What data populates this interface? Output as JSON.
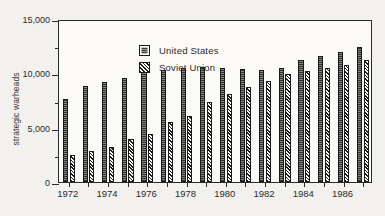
{
  "chart_data": {
    "type": "bar",
    "title": "",
    "xlabel": "",
    "ylabel": "strategic warheads",
    "ylim": [
      0,
      15000
    ],
    "yticks": [
      0,
      2500,
      5000,
      7500,
      10000,
      12500,
      15000
    ],
    "ytick_labels": [
      "0",
      "",
      "5,000",
      "",
      "10,000",
      "",
      "15,000"
    ],
    "ytick_major": [
      true,
      false,
      true,
      false,
      true,
      false,
      true
    ],
    "grid": false,
    "legend_position": "upper-left-inside",
    "categories": [
      "1972",
      "1973",
      "1974",
      "1975",
      "1976",
      "1977",
      "1978",
      "1979",
      "1980",
      "1981",
      "1982",
      "1983",
      "1984",
      "1985",
      "1986",
      "1987"
    ],
    "xtick_labels": [
      "1972",
      "",
      "1974",
      "",
      "1976",
      "",
      "1978",
      "",
      "1980",
      "",
      "1982",
      "",
      "1984",
      "",
      "1986",
      ""
    ],
    "series": [
      {
        "name": "United States",
        "color": "#6b6b6b",
        "pattern": "solid-dark",
        "values": [
          7600,
          8800,
          9200,
          9600,
          10200,
          10350,
          10450,
          10550,
          10450,
          10400,
          10300,
          10500,
          11250,
          11600,
          12000,
          12400
        ]
      },
      {
        "name": "Soviet Union",
        "color": "#ffffff",
        "pattern": "diagonal-hatch",
        "values": [
          2500,
          2900,
          3200,
          4000,
          4400,
          5500,
          6100,
          7400,
          8100,
          8700,
          9300,
          9900,
          10200,
          10500,
          10800,
          11200
        ]
      }
    ]
  },
  "legend": {
    "items": [
      {
        "label": "United States",
        "swatch": "solid-dark-swatch"
      },
      {
        "label": "Soviet Union",
        "swatch": "hatched-swatch"
      }
    ]
  },
  "axis": {
    "y_title": "strategic warheads"
  }
}
